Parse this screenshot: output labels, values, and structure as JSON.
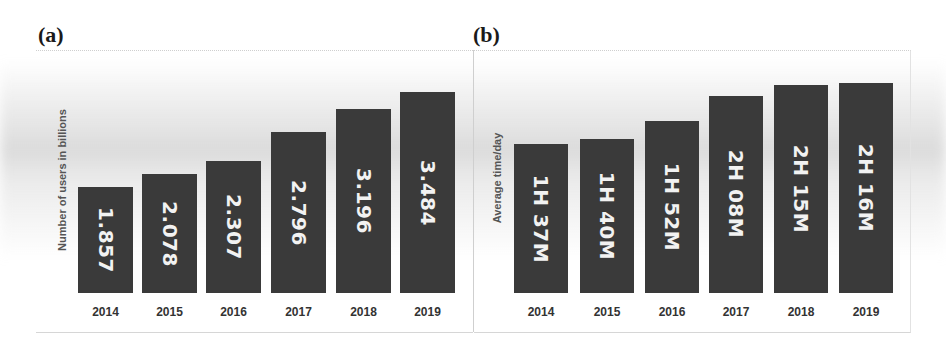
{
  "panels": {
    "a": {
      "label": "(a)",
      "ylabel": "Number of users in billions"
    },
    "b": {
      "label": "(b)",
      "ylabel": "Average time/day"
    }
  },
  "colors": {
    "bar": "#3a3a3a",
    "bar_text": "#f2f2f2",
    "axis_text": "#333333"
  },
  "chart_data": [
    {
      "type": "bar",
      "title": "(a)",
      "xlabel": "",
      "ylabel": "Number of users in billions",
      "categories": [
        "2014",
        "2015",
        "2016",
        "2017",
        "2018",
        "2019"
      ],
      "values": [
        1.857,
        2.078,
        2.307,
        2.796,
        3.196,
        3.484
      ],
      "data_labels": [
        "1.857",
        "2.078",
        "2.307",
        "2.796",
        "3.196",
        "3.484"
      ],
      "grid": false,
      "legend": null
    },
    {
      "type": "bar",
      "title": "(b)",
      "xlabel": "",
      "ylabel": "Average time/day",
      "categories": [
        "2014",
        "2015",
        "2016",
        "2017",
        "2018",
        "2019"
      ],
      "values_minutes": [
        97,
        100,
        112,
        128,
        135,
        136
      ],
      "data_labels": [
        "1H 37M",
        "1H 40M",
        "1H 52M",
        "2H 08M",
        "2H 15M",
        "2H 16M"
      ],
      "grid": false,
      "legend": null
    }
  ]
}
